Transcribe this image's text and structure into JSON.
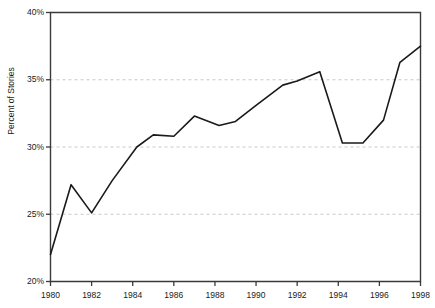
{
  "chart_data": {
    "type": "line",
    "title": "",
    "xlabel": "",
    "ylabel": "Percent of Stories",
    "xlim": [
      1980,
      1998
    ],
    "ylim": [
      20,
      40
    ],
    "grid": "horizontal-dashed-at-y-ticks",
    "legend": "none",
    "y_tick_labels": [
      "20%",
      "25%",
      "30%",
      "35%",
      "40%"
    ],
    "y_tick_values": [
      20,
      25,
      30,
      35,
      40
    ],
    "x_tick_labels": [
      "1980",
      "1982",
      "1984",
      "1986",
      "1988",
      "1990",
      "1992",
      "1994",
      "1996",
      "1998"
    ],
    "x_tick_values": [
      1980,
      1982,
      1984,
      1986,
      1988,
      1990,
      1992,
      1994,
      1996,
      1998
    ],
    "series": [
      {
        "name": "Percent of Stories",
        "x": [
          1980,
          1981,
          1982,
          1983,
          1984.2,
          1985,
          1986,
          1987,
          1988.2,
          1989,
          1990,
          1991.3,
          1992,
          1993.1,
          1994.2,
          1995.2,
          1996.2,
          1997,
          1998
        ],
        "values": [
          22.0,
          27.2,
          25.1,
          27.5,
          30.0,
          30.9,
          30.8,
          32.3,
          31.6,
          31.9,
          33.1,
          34.6,
          34.9,
          35.6,
          30.3,
          30.3,
          32.0,
          36.3,
          37.5
        ],
        "color": "#1a1a1a",
        "line_width": 1.6,
        "marker": "none"
      }
    ],
    "colors": {
      "line": "#1a1a1a",
      "axis": "#3a3a3a",
      "grid": "#c8c8c8",
      "text": "#1a1a1a",
      "background": "#ffffff"
    }
  }
}
